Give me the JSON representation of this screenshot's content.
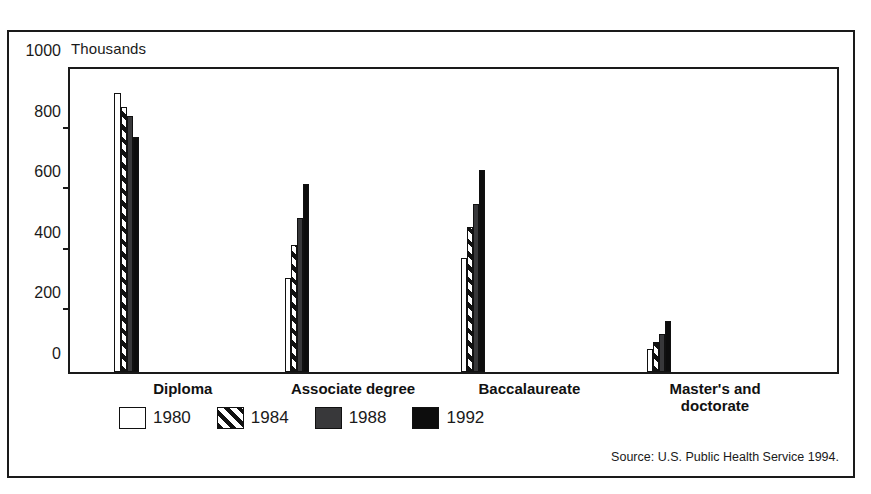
{
  "axis_units_label": "Thousands",
  "source_note": "Source: U.S. Public Health Service 1994.",
  "legend": [
    {
      "label": "1980",
      "fill": "open",
      "color": "#ffffff"
    },
    {
      "label": "1984",
      "fill": "hatch",
      "color": "#111111"
    },
    {
      "label": "1988",
      "fill": "gray",
      "color": "#38383a"
    },
    {
      "label": "1992",
      "fill": "black",
      "color": "#0d0d0d"
    }
  ],
  "chart_data": {
    "type": "bar",
    "title": "",
    "xlabel": "",
    "ylabel": "Thousands",
    "ylim": [
      0,
      1000
    ],
    "yticks": [
      0,
      200,
      400,
      600,
      800,
      1000
    ],
    "grid": false,
    "legend_position": "bottom",
    "categories": [
      "Diploma",
      "Associate degree",
      "Baccalaureate",
      "Master's and doctorate"
    ],
    "series": [
      {
        "name": "1980",
        "values": [
          920,
          310,
          375,
          75
        ]
      },
      {
        "name": "1984",
        "values": [
          875,
          420,
          478,
          98
        ]
      },
      {
        "name": "1988",
        "values": [
          845,
          508,
          553,
          125
        ]
      },
      {
        "name": "1992",
        "values": [
          775,
          620,
          668,
          170
        ]
      }
    ]
  }
}
